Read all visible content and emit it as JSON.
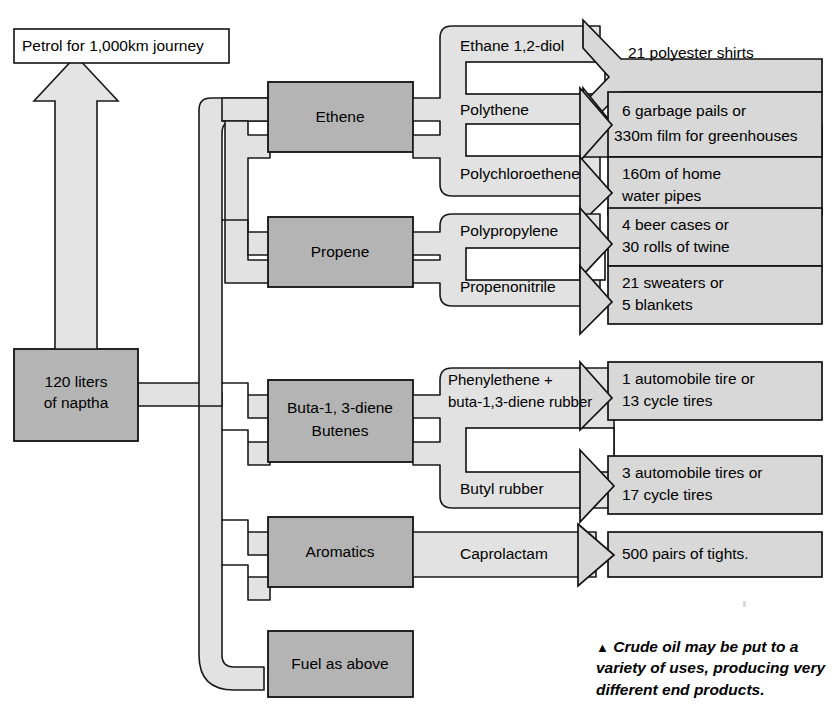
{
  "source": {
    "label_line1": "120 liters",
    "label_line2": "of naptha"
  },
  "petrol": {
    "label": "Petrol for 1,000km journey",
    "arrow_icon": "up-arrow-icon"
  },
  "fractions": [
    {
      "id": "ethene",
      "label_line1": "Ethene",
      "label_line2": ""
    },
    {
      "id": "propene",
      "label_line1": "Propene",
      "label_line2": ""
    },
    {
      "id": "butadiene",
      "label_line1": "Buta-1, 3-diene",
      "label_line2": "Butenes"
    },
    {
      "id": "aromatics",
      "label_line1": "Aromatics",
      "label_line2": ""
    },
    {
      "id": "fuel",
      "label_line1": "Fuel as above",
      "label_line2": ""
    }
  ],
  "intermediates": [
    {
      "id": "ethane-diol",
      "label_line1": "Ethane 1,2-diol",
      "label_line2": ""
    },
    {
      "id": "polythene",
      "label_line1": "Polythene",
      "label_line2": ""
    },
    {
      "id": "polychloroethene",
      "label_line1": "Polychloroethene",
      "label_line2": ""
    },
    {
      "id": "polypropylene",
      "label_line1": "Polypropylene",
      "label_line2": ""
    },
    {
      "id": "propenonitrile",
      "label_line1": "Propenonitrile",
      "label_line2": ""
    },
    {
      "id": "phenylethene",
      "label_line1": "Phenylethene +",
      "label_line2": "buta-1,3-diene rubber"
    },
    {
      "id": "butyl-rubber",
      "label_line1": "Butyl rubber",
      "label_line2": ""
    },
    {
      "id": "caprolactam",
      "label_line1": "Caprolactam",
      "label_line2": ""
    }
  ],
  "products": [
    {
      "id": "polyester-shirts",
      "line1": "21 polyester shirts",
      "line2": ""
    },
    {
      "id": "garbage-pails",
      "line1": "6 garbage pails or",
      "line2": "330m film for greenhouses"
    },
    {
      "id": "water-pipes",
      "line1": "160m of home",
      "line2": "water pipes"
    },
    {
      "id": "beer-cases",
      "line1": "4 beer cases or",
      "line2": "30 rolls of twine"
    },
    {
      "id": "sweaters",
      "line1": "21 sweaters or",
      "line2": "5 blankets"
    },
    {
      "id": "automobile-tire",
      "line1": "1 automobile tire or",
      "line2": "13 cycle tires"
    },
    {
      "id": "automobile-tires-3",
      "line1": "3 automobile tires or",
      "line2": "17 cycle tires"
    },
    {
      "id": "tights",
      "line1": "500 pairs of tights.",
      "line2": ""
    }
  ],
  "caption": {
    "marker": "▲",
    "line1": "Crude oil may be put to",
    "line2": "a variety of uses, producing",
    "line3": "very different end products."
  },
  "colors": {
    "fraction_box_fill": "#b4b4b4",
    "pipe_fill": "#e2e2e2",
    "product_bar_fill": "#d8d8d8",
    "outline": "#111111",
    "page_background": "#ffffff"
  }
}
